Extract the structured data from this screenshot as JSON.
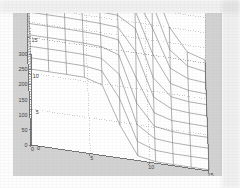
{
  "figure": {
    "background_color": "#d2d2d2",
    "axes_background_color": "#ffffff",
    "grid_color": "#a8a8a8",
    "axis_line_color": "#5a5a5a",
    "mesh_color": "#6e6e6e"
  },
  "chart_data": {
    "type": "surface",
    "title": "",
    "xlabel": "",
    "ylabel": "",
    "zlabel": "",
    "grid": true,
    "legend": null,
    "projection": "3d-mesh",
    "xlim": [
      0,
      15
    ],
    "ylim": [
      0,
      15
    ],
    "zlim": [
      0,
      300
    ],
    "x_ticks": [
      0,
      5,
      10,
      15
    ],
    "x_tick_labels": [
      "0",
      "5",
      "10",
      "15"
    ],
    "y_ticks": [
      0,
      5,
      10,
      15
    ],
    "y_tick_labels": [
      "0",
      "5",
      "10",
      "15"
    ],
    "z_ticks": [
      0,
      50,
      100,
      150,
      200,
      250,
      300
    ],
    "z_tick_labels": [
      "0",
      "50",
      "100",
      "150",
      "200",
      "250",
      "300"
    ],
    "surface": {
      "x": [
        0,
        1.5,
        3,
        4.5,
        6,
        7.5,
        9,
        10.5,
        12,
        13.5,
        15
      ],
      "y": [
        0,
        1.5,
        3,
        4.5,
        6,
        7.5,
        9,
        10.5,
        12,
        13.5,
        15
      ],
      "plateau_z": 250,
      "floor_z": 4,
      "transition_center_x": [
        4.2,
        4.9,
        5.6,
        6.3,
        7.0,
        7.7,
        8.4,
        9.1,
        9.8,
        10.5,
        11.2
      ],
      "transition_steepness": 2.6,
      "z": [
        [
          250,
          250,
          250,
          249,
          232,
          108,
          16,
          5,
          4,
          4,
          4
        ],
        [
          252,
          252,
          252,
          251,
          243,
          160,
          28,
          7,
          4,
          4,
          4
        ],
        [
          254,
          254,
          254,
          253,
          249,
          205,
          48,
          10,
          5,
          4,
          4
        ],
        [
          256,
          256,
          256,
          255,
          252,
          233,
          83,
          15,
          6,
          4,
          4
        ],
        [
          258,
          258,
          258,
          257,
          255,
          247,
          130,
          24,
          7,
          5,
          4
        ],
        [
          260,
          260,
          260,
          259,
          257,
          253,
          181,
          40,
          10,
          5,
          4
        ],
        [
          262,
          262,
          262,
          261,
          260,
          257,
          222,
          68,
          14,
          6,
          5
        ],
        [
          264,
          264,
          264,
          263,
          262,
          260,
          246,
          110,
          22,
          8,
          5
        ],
        [
          266,
          266,
          266,
          265,
          264,
          263,
          257,
          161,
          37,
          11,
          6
        ],
        [
          268,
          268,
          268,
          267,
          266,
          265,
          262,
          210,
          62,
          17,
          7
        ],
        [
          270,
          270,
          270,
          269,
          268,
          267,
          265,
          242,
          101,
          28,
          10
        ]
      ]
    }
  }
}
